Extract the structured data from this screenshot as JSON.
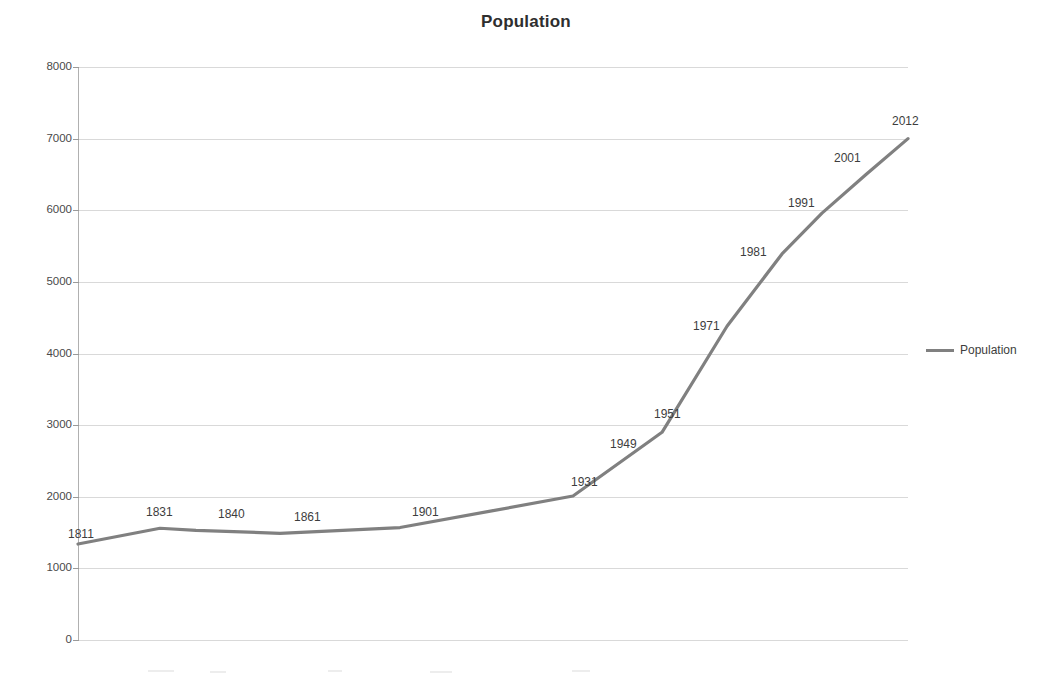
{
  "chart_data": {
    "type": "line",
    "title": "Population",
    "xlabel": "",
    "ylabel": "",
    "ylim": [
      0,
      8000
    ],
    "ytick_labels": [
      "8000",
      "7000",
      "6000",
      "5000",
      "4000",
      "3000",
      "2000",
      "1000",
      "0"
    ],
    "ytick_values": [
      8000,
      7000,
      6000,
      5000,
      4000,
      3000,
      2000,
      1000,
      0
    ],
    "grid": true,
    "legend_position": "right",
    "legend_entries": [
      "Population"
    ],
    "categories": [
      "1811",
      "1831",
      "1840",
      "1861",
      "1901",
      "1931",
      "1949",
      "1951",
      "1971",
      "1981",
      "1991",
      "2001",
      "2012"
    ],
    "point_labels": [
      "1811",
      "1831",
      "1840",
      "1861",
      "1901",
      "1931",
      "1949",
      "1951",
      "1971",
      "1981",
      "1991",
      "2001",
      "2012"
    ],
    "series": [
      {
        "name": "Population",
        "color": "#808080",
        "values": [
          1340,
          1560,
          1530,
          1490,
          1570,
          2010,
          2740,
          2900,
          4380,
          5390,
          5960,
          6500,
          7000
        ]
      }
    ]
  },
  "legend": {
    "label": "Population"
  }
}
